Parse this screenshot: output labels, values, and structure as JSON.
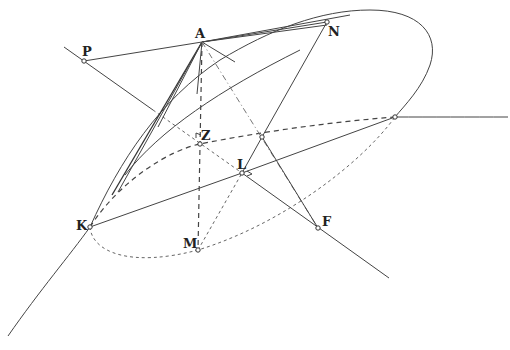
{
  "diagram": {
    "type": "geometric-construction",
    "labels": {
      "A": "A",
      "P": "P",
      "N": "N",
      "Z": "Z",
      "L": "L",
      "K": "K",
      "M": "M",
      "F": "F"
    },
    "points": {
      "A": [
        202,
        42
      ],
      "P": [
        84,
        61
      ],
      "N": [
        327,
        22
      ],
      "Z": [
        200,
        144
      ],
      "L": [
        242,
        173
      ],
      "K": [
        90,
        227
      ],
      "M": [
        198,
        250
      ],
      "F": [
        318,
        228
      ],
      "R": [
        395,
        117
      ],
      "X": [
        262,
        137
      ]
    },
    "colors": {
      "stroke": "#444444",
      "background": "#ffffff"
    }
  }
}
